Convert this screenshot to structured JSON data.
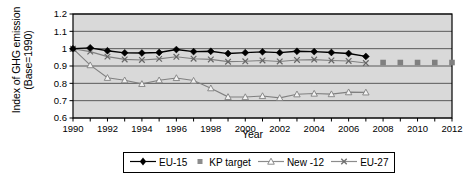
{
  "chart_data": {
    "type": "line",
    "title": "",
    "xlabel": "Year",
    "ylabel": "Index of GHG emission (Base=1990)",
    "ylabel_lines": [
      "Index of GHG emission",
      "(Base=1990)"
    ],
    "xlim": [
      1990,
      2012
    ],
    "ylim": [
      0.6,
      1.2
    ],
    "ytick_labels": [
      "1.2",
      "1.1",
      "1",
      "0.9",
      "0.8",
      "0.7",
      "0.6"
    ],
    "ytick_values": [
      1.2,
      1.1,
      1.0,
      0.9,
      0.8,
      0.7,
      0.6
    ],
    "xtick_labels": [
      "1990",
      "1992",
      "1994",
      "1996",
      "1998",
      "2000",
      "2002",
      "2004",
      "2006",
      "2008",
      "2010",
      "2012"
    ],
    "xtick_values": [
      1990,
      1992,
      1994,
      1996,
      1998,
      2000,
      2002,
      2004,
      2006,
      2008,
      2010,
      2012
    ],
    "x_minor_step": 1,
    "grid": "horizontal",
    "plot_background": "#d9d9d9",
    "legend_position": "bottom",
    "x": [
      1990,
      1991,
      1992,
      1993,
      1994,
      1995,
      1996,
      1997,
      1998,
      1999,
      2000,
      2001,
      2002,
      2003,
      2004,
      2005,
      2006,
      2007
    ],
    "series": [
      {
        "name": "EU-15",
        "color": "#000000",
        "marker": "filled-diamond",
        "x": [
          1990,
          1991,
          1992,
          1993,
          1994,
          1995,
          1996,
          1997,
          1998,
          1999,
          2000,
          2001,
          2002,
          2003,
          2004,
          2005,
          2006,
          2007
        ],
        "values": [
          1.0,
          1.005,
          0.988,
          0.976,
          0.975,
          0.978,
          0.995,
          0.983,
          0.985,
          0.972,
          0.977,
          0.982,
          0.977,
          0.985,
          0.983,
          0.978,
          0.972,
          0.955
        ]
      },
      {
        "name": "KP target",
        "color": "#808080",
        "marker": "filled-square",
        "x": [
          2008,
          2009,
          2010,
          2011,
          2012
        ],
        "values": [
          0.92,
          0.92,
          0.92,
          0.92,
          0.92
        ]
      },
      {
        "name": "New -12",
        "color": "#808080",
        "marker": "open-triangle",
        "x": [
          1990,
          1991,
          1992,
          1993,
          1994,
          1995,
          1996,
          1997,
          1998,
          1999,
          2000,
          2001,
          2002,
          2003,
          2004,
          2005,
          2006,
          2007
        ],
        "values": [
          1.0,
          0.905,
          0.832,
          0.818,
          0.797,
          0.818,
          0.831,
          0.816,
          0.772,
          0.722,
          0.721,
          0.727,
          0.716,
          0.737,
          0.741,
          0.738,
          0.749,
          0.748
        ]
      },
      {
        "name": "EU-27",
        "color": "#808080",
        "marker": "cross-x",
        "x": [
          1990,
          1991,
          1992,
          1993,
          1994,
          1995,
          1996,
          1997,
          1998,
          1999,
          2000,
          2001,
          2002,
          2003,
          2004,
          2005,
          2006,
          2007
        ],
        "values": [
          1.0,
          0.983,
          0.954,
          0.938,
          0.935,
          0.941,
          0.953,
          0.942,
          0.938,
          0.925,
          0.927,
          0.932,
          0.926,
          0.935,
          0.937,
          0.932,
          0.929,
          0.917
        ]
      }
    ]
  },
  "legend": {
    "entries": [
      {
        "label": "EU-15",
        "key": "line-filled-diamond"
      },
      {
        "label": "KP target",
        "key": "square"
      },
      {
        "label": "New -12",
        "key": "line-open-triangle"
      },
      {
        "label": "EU-27",
        "key": "line-cross-x"
      }
    ]
  }
}
